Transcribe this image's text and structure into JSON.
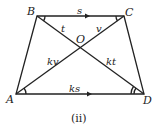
{
  "diagram": {
    "caption": "(ii)",
    "vertices": {
      "A": {
        "label": "A"
      },
      "B": {
        "label": "B"
      },
      "C": {
        "label": "C"
      },
      "D": {
        "label": "D"
      },
      "O": {
        "label": "O"
      }
    },
    "segment_labels": {
      "BC": "s",
      "AD": "ks",
      "BO": "t",
      "CO": "v",
      "AO": "kv",
      "DO": "kt"
    },
    "colors": {
      "stroke": "#222222",
      "background": "#ffffff"
    }
  }
}
